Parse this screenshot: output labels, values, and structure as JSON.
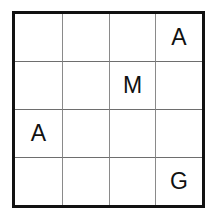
{
  "puzzle": {
    "rows": 4,
    "cols": 4,
    "cells": [
      [
        "",
        "",
        "",
        "A"
      ],
      [
        "",
        "",
        "M",
        ""
      ],
      [
        "A",
        "",
        "",
        ""
      ],
      [
        "",
        "",
        "",
        "G"
      ]
    ]
  }
}
